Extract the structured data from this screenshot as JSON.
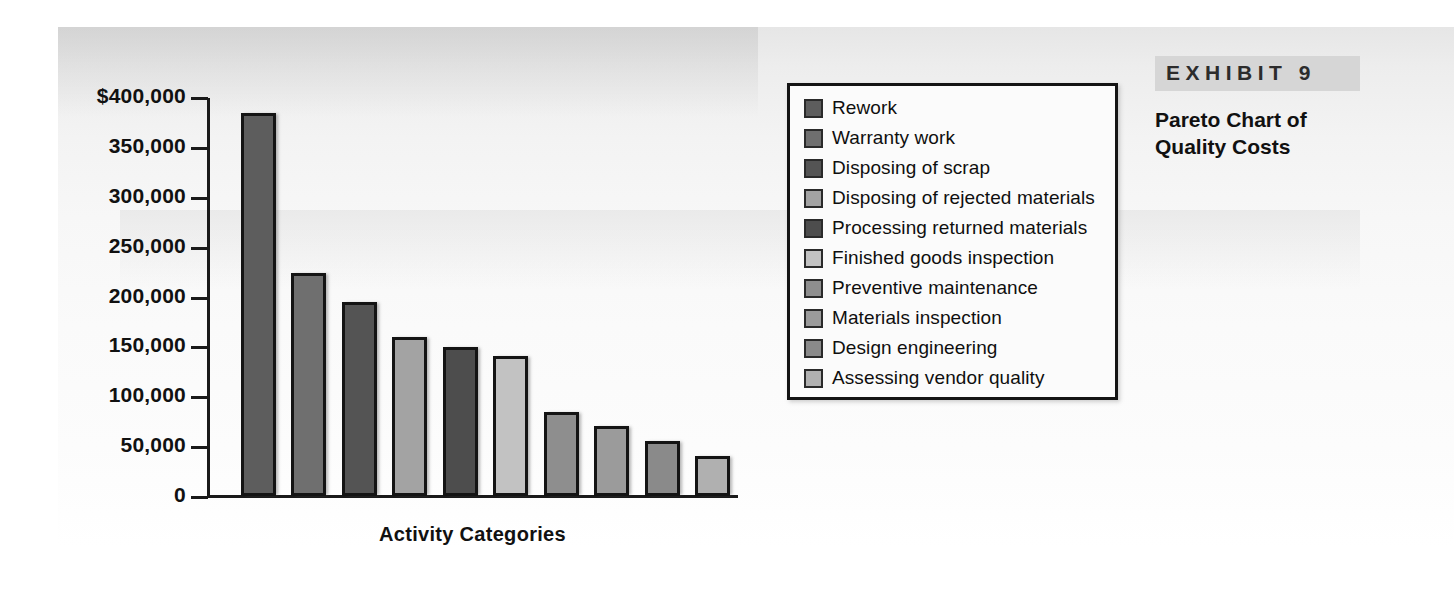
{
  "exhibit": {
    "number_label": "EXHIBIT 9",
    "title_line1": "Pareto Chart of",
    "title_line2": "Quality Costs",
    "band_color": "#d6d6d6"
  },
  "chart_data": {
    "type": "bar",
    "title": "Pareto Chart of Quality Costs",
    "xlabel": "Activity Categories",
    "ylabel": "",
    "ylim": [
      0,
      400000
    ],
    "ytick_values": [
      400000,
      350000,
      300000,
      250000,
      200000,
      150000,
      100000,
      50000,
      0
    ],
    "ytick_labels": [
      "$400,000",
      "350,000",
      "300,000",
      "250,000",
      "200,000",
      "150,000",
      "100,000",
      "50,000",
      "0"
    ],
    "grid": false,
    "legend_position": "inside-right",
    "categories": [
      "Rework",
      "Warranty work",
      "Disposing of scrap",
      "Disposing of rejected materials",
      "Processing returned materials",
      "Finished goods inspection",
      "Preventive maintenance",
      "Materials inspection",
      "Design engineering",
      "Assessing vendor quality"
    ],
    "values": [
      385000,
      225000,
      195000,
      160000,
      150000,
      141000,
      85000,
      71000,
      56000,
      41000
    ],
    "bar_colors": [
      "#5d5d5d",
      "#6f6f6f",
      "#545454",
      "#a3a3a3",
      "#4d4d4d",
      "#c2c2c2",
      "#8e8e8e",
      "#9b9b9b",
      "#8a8a8a",
      "#b0b0b0"
    ],
    "bar_edge_color": "#141414"
  },
  "axes": {
    "x_title": "Activity Categories"
  },
  "legend": {
    "items": [
      {
        "label": "Rework",
        "color": "#5d5d5d"
      },
      {
        "label": "Warranty work",
        "color": "#6f6f6f"
      },
      {
        "label": "Disposing of scrap",
        "color": "#545454"
      },
      {
        "label": "Disposing of rejected materials",
        "color": "#a3a3a3"
      },
      {
        "label": "Processing returned materials",
        "color": "#4d4d4d"
      },
      {
        "label": "Finished goods inspection",
        "color": "#c2c2c2"
      },
      {
        "label": "Preventive maintenance",
        "color": "#8e8e8e"
      },
      {
        "label": "Materials inspection",
        "color": "#9b9b9b"
      },
      {
        "label": "Design engineering",
        "color": "#8a8a8a"
      },
      {
        "label": "Assessing vendor quality",
        "color": "#b0b0b0"
      }
    ]
  }
}
